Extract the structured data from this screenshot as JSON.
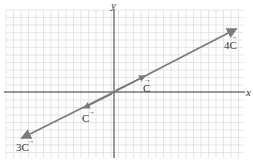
{
  "diagram": {
    "axes": {
      "x_label": "x",
      "y_label": "y"
    },
    "vectors": [
      {
        "name": "C",
        "label": "C",
        "scalar": "",
        "arrow": "→"
      },
      {
        "name": "-C",
        "label": "C",
        "scalar": "",
        "prefix": "−",
        "arrow": "→"
      },
      {
        "name": "4C",
        "label": "C",
        "scalar": "4",
        "arrow": "→"
      },
      {
        "name": "-3C",
        "label": "C",
        "scalar": "3",
        "prefix": "−",
        "arrow": "→"
      }
    ],
    "colors": {
      "vector": "#7a7a7a",
      "grid": "#cfcfcf",
      "axis": "#333333"
    }
  }
}
